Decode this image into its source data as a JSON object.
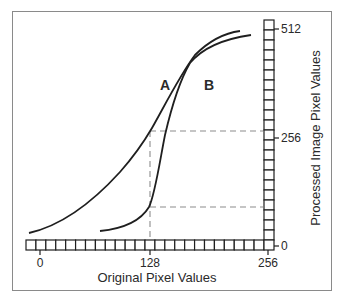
{
  "chart_data": {
    "type": "line",
    "title": "",
    "xlabel": "Original Pixel Values",
    "ylabel": "Processed Image Pixel Values",
    "x_ticks": [
      "0",
      "128",
      "256"
    ],
    "y_ticks": [
      "0",
      "256",
      "512"
    ],
    "xlim": [
      0,
      256
    ],
    "ylim": [
      0,
      512
    ],
    "grid": false,
    "legend": "inline curve labels",
    "series": [
      {
        "name": "A",
        "x": [
          -10,
          20,
          60,
          100,
          128,
          150,
          175,
          200,
          236
        ],
        "y": [
          15,
          40,
          100,
          185,
          256,
          330,
          410,
          460,
          492
        ]
      },
      {
        "name": "B",
        "x": [
          70,
          100,
          120,
          128,
          140,
          155,
          170,
          190,
          215,
          248
        ],
        "y": [
          15,
          35,
          65,
          95,
          170,
          256,
          345,
          420,
          460,
          480
        ]
      }
    ],
    "annotations": [
      {
        "type": "dashed-guide",
        "from": [
          128,
          0
        ],
        "to": [
          128,
          256
        ],
        "note": "vertical guide at x=128"
      },
      {
        "type": "dashed-guide",
        "from": [
          128,
          256
        ],
        "to": [
          256,
          256
        ],
        "note": "curve A output at 128"
      },
      {
        "type": "dashed-guide",
        "from": [
          128,
          95
        ],
        "to": [
          256,
          95
        ],
        "note": "curve B output at 128"
      }
    ]
  },
  "labels": {
    "curve_a": "A",
    "curve_b": "B",
    "x_axis_title": "Original Pixel Values",
    "y_axis_title": "Processed Image Pixel Values",
    "x_tick_0": "0",
    "x_tick_128": "128",
    "x_tick_256": "256",
    "y_tick_0": "0",
    "y_tick_256": "256",
    "y_tick_512": "512"
  },
  "colors": {
    "curve": "#1f1f1f",
    "dashed": "#8c8c8c",
    "frame": "#8a8a8a",
    "axis_bar": "#1f1f1f"
  }
}
